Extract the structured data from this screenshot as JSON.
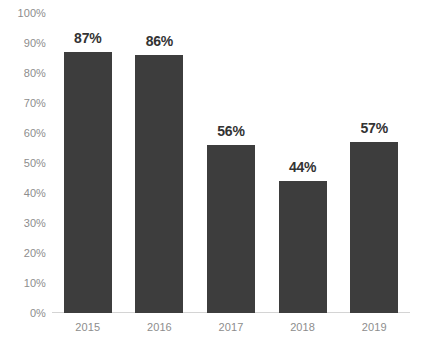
{
  "chart_data": {
    "type": "bar",
    "title": "",
    "subtitle": "",
    "xlabel": "",
    "ylabel": "",
    "categories": [
      "2015",
      "2016",
      "2017",
      "2018",
      "2019"
    ],
    "values": [
      87,
      86,
      56,
      44,
      57
    ],
    "data_labels": [
      "87%",
      "86%",
      "56%",
      "44%",
      "57%"
    ],
    "ylim": [
      0,
      100
    ],
    "ytick_values": [
      0,
      10,
      20,
      30,
      40,
      50,
      60,
      70,
      80,
      90,
      100
    ],
    "ytick_labels": [
      "0%",
      "10%",
      "20%",
      "30%",
      "40%",
      "50%",
      "60%",
      "70%",
      "80%",
      "90%",
      "100%"
    ],
    "grid": false,
    "legend": null,
    "legend_position": "none",
    "series": [
      {
        "name": "",
        "values": [
          87,
          86,
          56,
          44,
          57
        ]
      }
    ],
    "colors": {
      "bar_fill": "#3d3d3d",
      "background": "#ffffff",
      "axis_line": "#d4d4d4",
      "tick_label": "#8d8d8d",
      "data_label": "#333333"
    }
  }
}
